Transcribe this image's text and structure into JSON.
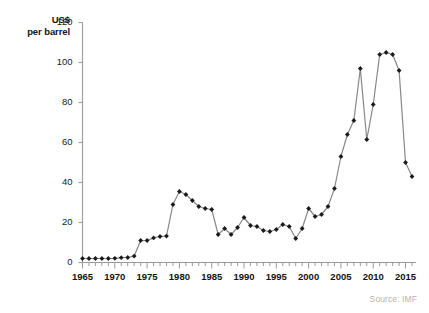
{
  "chart_data": {
    "type": "line",
    "title": "",
    "ylabel": "US$ per barrel",
    "ylabel_line1": "US$",
    "ylabel_line2": "per barrel",
    "xlabel": "",
    "ylim": [
      0,
      120
    ],
    "xlim": [
      1965,
      2016
    ],
    "yticks": [
      0,
      20,
      40,
      60,
      80,
      100,
      120
    ],
    "xticks": [
      1965,
      1970,
      1975,
      1980,
      1985,
      1990,
      1995,
      2000,
      2005,
      2010,
      2015
    ],
    "x_minor_tick_step": 1,
    "grid": false,
    "legend": false,
    "marker": "diamond",
    "line_color": "#888888",
    "marker_color": "#1a1a1a",
    "axis_color": "#9a9a9a",
    "x": [
      1965,
      1966,
      1967,
      1968,
      1969,
      1970,
      1971,
      1972,
      1973,
      1974,
      1975,
      1976,
      1977,
      1978,
      1979,
      1980,
      1981,
      1982,
      1983,
      1984,
      1985,
      1986,
      1987,
      1988,
      1989,
      1990,
      1991,
      1992,
      1993,
      1994,
      1995,
      1996,
      1997,
      1998,
      1999,
      2000,
      2001,
      2002,
      2003,
      2004,
      2005,
      2006,
      2007,
      2008,
      2009,
      2010,
      2011,
      2012,
      2013,
      2014,
      2015,
      2016
    ],
    "values": [
      2.0,
      2.0,
      2.0,
      2.0,
      2.0,
      2.1,
      2.4,
      2.5,
      3.2,
      11.0,
      11.0,
      12.3,
      13.0,
      13.2,
      29.0,
      35.5,
      34.0,
      31.0,
      28.0,
      27.0,
      26.5,
      14.0,
      17.0,
      14.0,
      17.5,
      22.5,
      18.5,
      18.0,
      16.0,
      15.5,
      16.5,
      19.0,
      18.0,
      12.0,
      17.0,
      27.0,
      23.0,
      24.0,
      28.0,
      37.0,
      53.0,
      64.0,
      71.0,
      97.0,
      61.5,
      79.0,
      104.0,
      105.0,
      104.0,
      96.0,
      50.0,
      43.0
    ]
  },
  "source": {
    "label": "Source: IMF"
  }
}
